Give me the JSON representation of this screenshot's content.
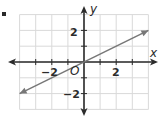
{
  "chart_data": {
    "type": "line",
    "title": "",
    "xlabel": "x",
    "ylabel": "y",
    "origin_label": "O",
    "xlim": [
      -4,
      4
    ],
    "ylim": [
      -3,
      3
    ],
    "grid": true,
    "x_tick_labels": [
      {
        "value": -2,
        "label": "−2"
      },
      {
        "value": 2,
        "label": "2"
      }
    ],
    "y_tick_labels": [
      {
        "value": 2,
        "label": "2"
      },
      {
        "value": -2,
        "label": "−2"
      }
    ],
    "series": [
      {
        "name": "line",
        "equation": "y = 0.5x",
        "x": [
          -4,
          4
        ],
        "y": [
          -2,
          2
        ],
        "arrows_both_ends": true,
        "color": "#777777"
      }
    ]
  },
  "colors": {
    "grid": "#d9d9d9",
    "axis": "#2b2b2b",
    "line": "#777777"
  }
}
